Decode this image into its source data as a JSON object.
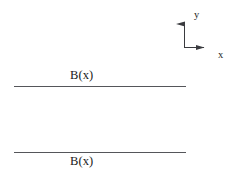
{
  "figure": {
    "background_color": "#ffffff",
    "line_color": "#55565a",
    "axis_color": "#3a3b3f",
    "text_color": "#1a1a1a",
    "width": 236,
    "height": 180
  },
  "axes": {
    "origin": {
      "x": 184,
      "y": 48
    },
    "y_axis": {
      "label": "y",
      "from": {
        "x": 184,
        "y": 48
      },
      "to": {
        "x": 184,
        "y": 16
      },
      "arrow": "up",
      "label_position": {
        "x": 194,
        "y": 10
      }
    },
    "x_axis": {
      "label": "x",
      "from": {
        "x": 184,
        "y": 48
      },
      "to": {
        "x": 212,
        "y": 48
      },
      "arrow": "right",
      "label_position": {
        "x": 218,
        "y": 50
      }
    }
  },
  "boundaries": [
    {
      "label": "B(x)",
      "name": "upper-boundary",
      "y": 86,
      "x_start": 14,
      "x_end": 186,
      "label_position": {
        "x": 70,
        "y": 69
      },
      "label_placement": "above"
    },
    {
      "label": "B(x)",
      "name": "lower-boundary",
      "y": 152,
      "x_start": 14,
      "x_end": 186,
      "label_position": {
        "x": 70,
        "y": 155
      },
      "label_placement": "below"
    }
  ]
}
